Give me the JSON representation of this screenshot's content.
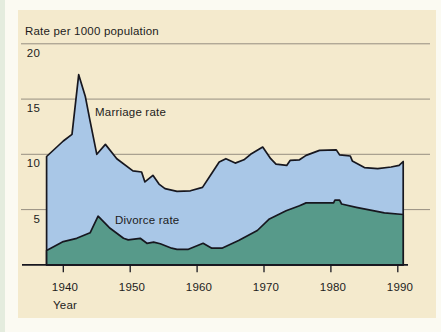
{
  "chart_data": {
    "type": "area",
    "title": "Rate per 1000 population",
    "xlabel": "Year",
    "x_ticks": [
      1940,
      1950,
      1960,
      1970,
      1980,
      1990
    ],
    "y_ticks": [
      5,
      10,
      15,
      20
    ],
    "xlim": [
      1937.5,
      1990.8
    ],
    "ylim": [
      0,
      21
    ],
    "grid": "horizontal",
    "legend": "inline-labels",
    "colors": {
      "panel": "#F4EACD",
      "line": "#17171F",
      "gridline": "#8B8478",
      "text": "#1C1C1C",
      "marriage_fill": "#A9C7E7",
      "divorce_fill": "#579A8A"
    },
    "series": [
      {
        "name": "Marriage rate",
        "fill": "#A9C7E7",
        "points": [
          [
            1937.5,
            9.8
          ],
          [
            1940,
            11.2
          ],
          [
            1941.3,
            11.8
          ],
          [
            1942.3,
            17.2
          ],
          [
            1943.3,
            15.2
          ],
          [
            1944,
            13.0
          ],
          [
            1945,
            10.0
          ],
          [
            1946.3,
            10.9
          ],
          [
            1948,
            9.6
          ],
          [
            1950.4,
            8.5
          ],
          [
            1951.7,
            8.4
          ],
          [
            1952.2,
            7.5
          ],
          [
            1953.4,
            8.1
          ],
          [
            1954.3,
            7.3
          ],
          [
            1955.2,
            6.9
          ],
          [
            1957,
            6.65
          ],
          [
            1959,
            6.7
          ],
          [
            1960.8,
            7.0
          ],
          [
            1962,
            8.1
          ],
          [
            1963.3,
            9.3
          ],
          [
            1964.3,
            9.6
          ],
          [
            1965.7,
            9.2
          ],
          [
            1967,
            9.5
          ],
          [
            1968,
            10.0
          ],
          [
            1969.8,
            10.65
          ],
          [
            1971,
            9.6
          ],
          [
            1971.8,
            9.1
          ],
          [
            1973.4,
            9.0
          ],
          [
            1973.9,
            9.45
          ],
          [
            1975.3,
            9.5
          ],
          [
            1976.3,
            9.9
          ],
          [
            1977.6,
            10.2
          ],
          [
            1978.3,
            10.35
          ],
          [
            1980.8,
            10.4
          ],
          [
            1981.3,
            9.95
          ],
          [
            1982.9,
            9.85
          ],
          [
            1983.2,
            9.4
          ],
          [
            1985,
            8.8
          ],
          [
            1987,
            8.7
          ],
          [
            1989,
            8.85
          ],
          [
            1990.2,
            9.0
          ],
          [
            1990.8,
            9.35
          ]
        ]
      },
      {
        "name": "Divorce rate",
        "fill": "#579A8A",
        "points": [
          [
            1937.5,
            1.3
          ],
          [
            1940,
            2.1
          ],
          [
            1942,
            2.4
          ],
          [
            1944,
            2.9
          ],
          [
            1945.2,
            4.4
          ],
          [
            1947,
            3.3
          ],
          [
            1949,
            2.4
          ],
          [
            1949.7,
            2.25
          ],
          [
            1951.5,
            2.4
          ],
          [
            1952.5,
            1.95
          ],
          [
            1953.5,
            2.05
          ],
          [
            1954.5,
            1.9
          ],
          [
            1956.2,
            1.5
          ],
          [
            1957,
            1.4
          ],
          [
            1958.7,
            1.4
          ],
          [
            1960.9,
            1.95
          ],
          [
            1962.2,
            1.5
          ],
          [
            1963.7,
            1.5
          ],
          [
            1966.2,
            2.2
          ],
          [
            1969,
            3.1
          ],
          [
            1970.8,
            4.15
          ],
          [
            1973.3,
            4.9
          ],
          [
            1975.3,
            5.35
          ],
          [
            1976.3,
            5.6
          ],
          [
            1980.4,
            5.6
          ],
          [
            1980.6,
            5.85
          ],
          [
            1981.3,
            5.85
          ],
          [
            1981.6,
            5.5
          ],
          [
            1983.8,
            5.2
          ],
          [
            1986.3,
            4.9
          ],
          [
            1988,
            4.7
          ],
          [
            1990.8,
            4.55
          ]
        ]
      }
    ]
  }
}
